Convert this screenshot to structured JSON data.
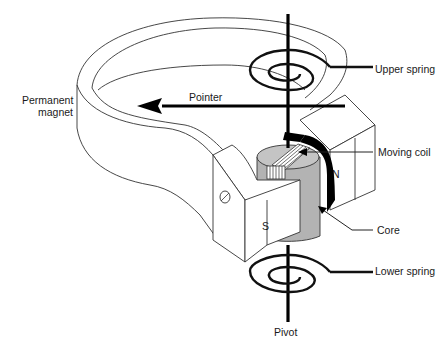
{
  "diagram": {
    "labels": {
      "permanent_magnet_line1": "Permanent",
      "permanent_magnet_line2": "magnet",
      "pointer": "Pointer",
      "upper_spring": "Upper spring",
      "moving_coil": "Moving coil",
      "core": "Core",
      "lower_spring": "Lower spring",
      "pivot": "Pivot",
      "north_pole": "N",
      "south_pole": "S"
    },
    "colors": {
      "line": "#333333",
      "heavy": "#000000",
      "core_fill": "#b3b3b3",
      "coil_fill": "#ffffff",
      "background": "#ffffff"
    }
  }
}
